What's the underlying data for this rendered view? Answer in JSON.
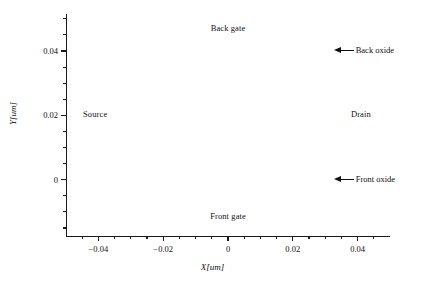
{
  "chart_data": {
    "type": "diagram",
    "title": "",
    "xlabel": "X[um]",
    "ylabel": "Y[um]",
    "xlim": [
      -0.05,
      0.05
    ],
    "ylim": [
      0.0515,
      -0.0175
    ],
    "y_inverted": true,
    "grid": false,
    "legend": "none",
    "xticks": [
      {
        "value": -0.04,
        "label": "−0.04"
      },
      {
        "value": -0.02,
        "label": "−0.02"
      },
      {
        "value": 0,
        "label": "0"
      },
      {
        "value": 0.02,
        "label": "0.02"
      },
      {
        "value": 0.04,
        "label": "0.04"
      }
    ],
    "yticks": [
      {
        "value": 0,
        "label": "0"
      },
      {
        "value": 0.02,
        "label": "0.02"
      },
      {
        "value": 0.04,
        "label": "0.04"
      }
    ],
    "x_minor_ticks": [
      -0.045,
      -0.035,
      -0.03,
      -0.025,
      -0.015,
      -0.01,
      -0.005,
      0.005,
      0.01,
      0.015,
      0.025,
      0.03,
      0.035,
      0.045
    ],
    "y_minor_ticks": [
      -0.015,
      -0.01,
      -0.005,
      0.005,
      0.01,
      0.015,
      0.025,
      0.03,
      0.035,
      0.045,
      0.05
    ],
    "regions": [
      {
        "name": "front-gate",
        "label": "Front gate",
        "x0": -0.032,
        "x1": 0.032,
        "y0": -0.0175,
        "y1": -0.0015,
        "color": "#575757",
        "label_y": -0.0115
      },
      {
        "name": "front-oxide",
        "label": "",
        "x0": -0.032,
        "x1": 0.032,
        "y0": -0.0015,
        "y1": 0.0018,
        "color": "#232323",
        "label_y": null
      },
      {
        "name": "channel-body",
        "label": "",
        "x0": -0.032,
        "x1": 0.032,
        "y0": 0.0018,
        "y1": 0.0385,
        "color": "#3d3d3d",
        "label_y": null
      },
      {
        "name": "back-oxide",
        "label": "",
        "x0": -0.032,
        "x1": 0.032,
        "y0": 0.0385,
        "y1": 0.0418,
        "color": "#232323",
        "label_y": null
      },
      {
        "name": "back-gate",
        "label": "Back gate",
        "x0": -0.032,
        "x1": 0.032,
        "y0": 0.0418,
        "y1": 0.0515,
        "color": "#575757",
        "label_y": 0.0468
      },
      {
        "name": "source",
        "label": "Source",
        "x0": -0.05,
        "x1": -0.032,
        "y0": 0,
        "y1": 0.04,
        "color": "#6e6e6e",
        "label_y": 0.02
      },
      {
        "name": "source-band-inner",
        "label": "",
        "x0": -0.0385,
        "x1": -0.0335,
        "y0": 0,
        "y1": 0.04,
        "color": "#8a8a8a",
        "label_y": null
      },
      {
        "name": "source-band-edge",
        "label": "",
        "x0": -0.0335,
        "x1": -0.032,
        "y0": 0,
        "y1": 0.04,
        "color": "#a2a2a2",
        "label_y": null
      },
      {
        "name": "drain",
        "label": "Drain",
        "x0": 0.032,
        "x1": 0.05,
        "y0": 0,
        "y1": 0.04,
        "color": "#6e6e6e",
        "label_y": 0.02
      },
      {
        "name": "drain-band-edge",
        "label": "",
        "x0": 0.032,
        "x1": 0.0335,
        "y0": 0,
        "y1": 0.04,
        "color": "#a2a2a2",
        "label_y": null
      },
      {
        "name": "drain-band-inner",
        "label": "",
        "x0": 0.0335,
        "x1": 0.0385,
        "y0": 0,
        "y1": 0.04,
        "color": "#8a8a8a",
        "label_y": null
      }
    ],
    "annotations": [
      {
        "name": "front-oxide",
        "text": "Front oxide",
        "target_x": 0.032,
        "target_y": 0.0002,
        "arrow": "arrow-left-icon"
      },
      {
        "name": "back-oxide",
        "text": "Back oxide",
        "target_x": 0.032,
        "target_y": 0.0402,
        "arrow": "arrow-left-icon"
      }
    ],
    "colors": {
      "gate": "#575757",
      "oxide": "#232323",
      "body": "#3d3d3d",
      "contact": "#6e6e6e",
      "contact_light": "#8a8a8a",
      "contact_lighter": "#a2a2a2",
      "axis": "#1a1a1a",
      "background": "#ffffff"
    }
  }
}
